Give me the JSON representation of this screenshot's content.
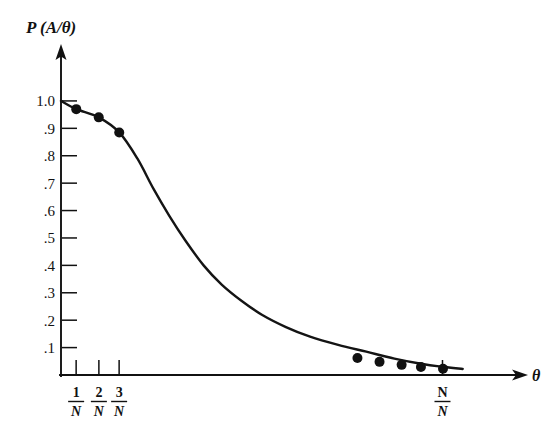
{
  "figure": {
    "width": 558,
    "height": 438,
    "background_color": "#ffffff",
    "ink_color": "#111111"
  },
  "chart_data": {
    "type": "line",
    "title": "P (A/θ)",
    "subtitle": "",
    "xlabel": "θ",
    "ylabel": "P (A/θ)",
    "ylabel_text_parts": {
      "p": "P",
      "open_paren": "(",
      "a": "A",
      "slash": "/",
      "theta": "θ",
      "close_paren": ")"
    },
    "grid": false,
    "legend": "none",
    "xlim": [
      0,
      1.18
    ],
    "ylim": [
      0,
      1.08
    ],
    "ytick_labels": [
      "1.0",
      ".9",
      ".8",
      ".7",
      ".6",
      ".5",
      ".4",
      ".3",
      ".2",
      ".1"
    ],
    "ytick_values": [
      1.0,
      0.9,
      0.8,
      0.7,
      0.6,
      0.5,
      0.4,
      0.3,
      0.2,
      0.1
    ],
    "xtick_labels": [
      {
        "numerator": "1",
        "denominator": "N",
        "value": 0.0377
      },
      {
        "numerator": "2",
        "denominator": "N",
        "value": 0.0943
      },
      {
        "numerator": "3",
        "denominator": "N",
        "value": 0.1447
      },
      {
        "numerator": "N",
        "denominator": "N",
        "value": 0.9497
      }
    ],
    "xtick_label_text": [
      "1/N",
      "2/N",
      "3/N",
      "N/N"
    ],
    "axis_arrows": {
      "x": true,
      "y": true
    },
    "series": [
      {
        "name": "P(A|θ)",
        "marker": "filled-circle",
        "marker_size": 5,
        "line_width": 2.4,
        "x": [
          0.0,
          0.038,
          0.094,
          0.145,
          0.19,
          0.23,
          0.27,
          0.31,
          0.355,
          0.4,
          0.45,
          0.5,
          0.56,
          0.62,
          0.69,
          0.76,
          0.83,
          0.9,
          0.95,
          1.0
        ],
        "y": [
          1.0,
          0.97,
          0.94,
          0.885,
          0.79,
          0.68,
          0.58,
          0.49,
          0.4,
          0.33,
          0.27,
          0.22,
          0.175,
          0.14,
          0.11,
          0.085,
          0.06,
          0.04,
          0.03,
          0.022
        ],
        "marked_points": [
          {
            "x": 0.038,
            "y": 0.97
          },
          {
            "x": 0.094,
            "y": 0.94
          },
          {
            "x": 0.145,
            "y": 0.885
          },
          {
            "x": 0.738,
            "y": 0.062
          },
          {
            "x": 0.793,
            "y": 0.048
          },
          {
            "x": 0.848,
            "y": 0.037
          },
          {
            "x": 0.896,
            "y": 0.029
          },
          {
            "x": 0.951,
            "y": 0.023
          }
        ]
      }
    ]
  }
}
